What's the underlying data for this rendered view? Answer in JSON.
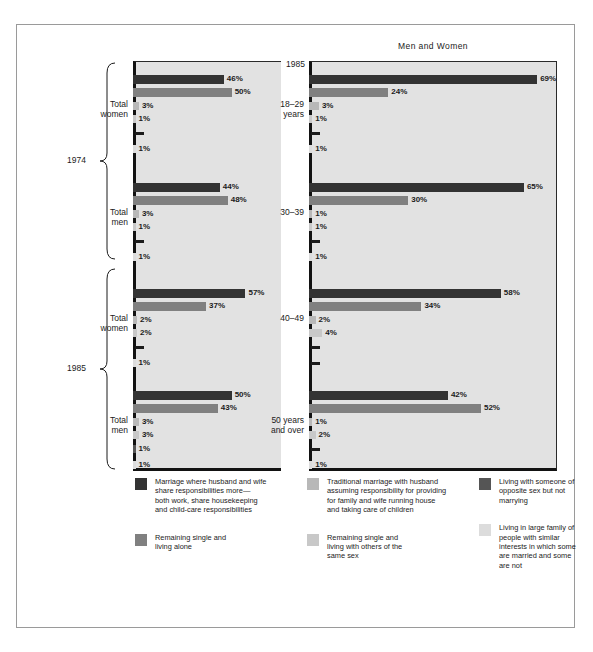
{
  "chart_data": {
    "type": "bar",
    "title": "",
    "xlabel": "",
    "ylabel": "",
    "xlim": [
      0,
      75
    ],
    "grid": false,
    "legend_position": "bottom",
    "series": [
      {
        "name": "Marriage where husband and wife share responsibilities more—both work, share housekeeping and child-care responsibilities",
        "color": "#333333"
      },
      {
        "name": "Remaining single and living alone",
        "color": "#808080"
      },
      {
        "name": "Traditional marriage with husband assuming responsibility for providing for family and wife running house and taking care of children",
        "color": "#b8b8b8"
      },
      {
        "name": "Remaining single and living with others of the same sex",
        "color": "#c8c8c8"
      },
      {
        "name": "Living with someone of opposite sex but not marrying",
        "color": "#555555"
      },
      {
        "name": "Living in large family of people with similar interests in which some are married and some are not",
        "color": "#dcdcdc"
      }
    ],
    "panels": [
      {
        "id": "left",
        "title": "",
        "year_label": "",
        "groups": [
          {
            "category": "Total\nwomen",
            "era": "1974",
            "values": [
              46,
              50,
              3,
              1,
              0,
              1
            ],
            "labels": [
              "46%",
              "50%",
              "3%",
              "1%",
              "—",
              "1%"
            ]
          },
          {
            "category": "Total\nmen",
            "era": "1974",
            "values": [
              44,
              48,
              3,
              1,
              0,
              1
            ],
            "labels": [
              "44%",
              "48%",
              "3%",
              "1%",
              "—",
              "1%"
            ]
          },
          {
            "category": "Total\nwomen",
            "era": "1985",
            "values": [
              57,
              37,
              2,
              2,
              0,
              1
            ],
            "labels": [
              "57%",
              "37%",
              "2%",
              "2%",
              "—",
              "1%"
            ]
          },
          {
            "category": "Total\nmen",
            "era": "1985",
            "values": [
              50,
              43,
              3,
              3,
              1,
              1
            ],
            "labels": [
              "50%",
              "43%",
              "3%",
              "3%",
              "1%",
              "1%"
            ]
          }
        ]
      },
      {
        "id": "right",
        "title": "Men and Women",
        "year_label": "1985",
        "groups": [
          {
            "category": "18–29\nyears",
            "values": [
              69,
              24,
              3,
              1,
              0,
              1
            ],
            "labels": [
              "69%",
              "24%",
              "3%",
              "1%",
              "—",
              "1%"
            ]
          },
          {
            "category": "30–39",
            "values": [
              65,
              30,
              1,
              1,
              0,
              1
            ],
            "labels": [
              "65%",
              "30%",
              "1%",
              "1%",
              "—",
              "1%"
            ]
          },
          {
            "category": "40–49",
            "values": [
              58,
              34,
              2,
              4,
              0,
              0
            ],
            "labels": [
              "58%",
              "34%",
              "2%",
              "4%",
              "—",
              "—"
            ]
          },
          {
            "category": "50 years\nand over",
            "values": [
              42,
              52,
              1,
              2,
              0,
              1
            ],
            "labels": [
              "42%",
              "52%",
              "1%",
              "2%",
              "—",
              "1%"
            ]
          }
        ]
      }
    ],
    "era_braces": [
      {
        "label": "1974"
      },
      {
        "label": "1985"
      }
    ]
  },
  "legend": {
    "columns": [
      {
        "items": [
          {
            "swatch_color": "#333333",
            "label": "Marriage where husband and wife\nshare responsibilities more—\nboth work, share housekeeping\nand child-care responsibilities"
          },
          {
            "swatch_color": "#808080",
            "label": "Remaining single and\nliving alone"
          }
        ]
      },
      {
        "items": [
          {
            "swatch_color": "#b8b8b8",
            "label": "Traditional marriage with husband\nassuming responsibility for providing\nfor family and wife running house\nand taking care of children"
          },
          {
            "swatch_color": "#c8c8c8",
            "label": "Remaining single and\nliving with others of the\nsame sex"
          }
        ]
      },
      {
        "items": [
          {
            "swatch_color": "#555555",
            "label": "Living with someone of\nopposite sex but not\nmarrying"
          },
          {
            "swatch_color": "#dcdcdc",
            "label": "Living in large family of\npeople with similar\ninterests in which some\nare married and some\nare not"
          }
        ]
      }
    ]
  }
}
